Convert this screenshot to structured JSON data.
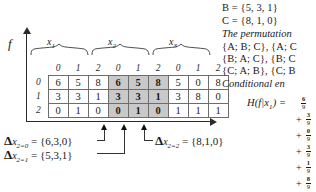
{
  "figure": {
    "axis": {
      "y_label": "f",
      "x_label": "x"
    },
    "groups": [
      {
        "name": "x",
        "sub": "1"
      },
      {
        "name": "x",
        "sub": "2"
      },
      {
        "name": "x",
        "sub": "3"
      }
    ],
    "table": {
      "column_headers": [
        "0",
        "1",
        "2",
        "0",
        "1",
        "2",
        "0",
        "1",
        "2"
      ],
      "row_headers": [
        "0",
        "1",
        "2"
      ],
      "rows": [
        [
          "6",
          "5",
          "8",
          "6",
          "5",
          "8",
          "5",
          "0",
          "8"
        ],
        [
          "3",
          "3",
          "1",
          "3",
          "3",
          "1",
          "3",
          "8",
          "0"
        ],
        [
          "0",
          "1",
          "0",
          "0",
          "1",
          "0",
          "1",
          "1",
          "1"
        ]
      ],
      "highlight_columns": [
        3,
        4,
        5
      ],
      "highlight_color": "#c9c9c9"
    },
    "annotations": [
      {
        "symbol": "Δ",
        "var": "x",
        "sub": "2=0",
        "eq": "=",
        "set": "{6,3,0}"
      },
      {
        "symbol": "Δ",
        "var": "x",
        "sub": "2=1",
        "eq": "=",
        "set": "{5,3,1}"
      },
      {
        "symbol": "Δ",
        "var": "x",
        "sub": "2=2",
        "eq": "=",
        "set": "{8,1,0}"
      }
    ]
  },
  "sidebar": {
    "set_b": "B = {5, 3, 1}",
    "set_c": "C = {8, 1, 0}",
    "permutation_intro": "The permutation",
    "permutation_lines": [
      "{A; B; C}, {A; C",
      "{B; A; C}, {B; C",
      "{C; A; B}, {C; B"
    ],
    "conditional_label": "Conditional   en",
    "entropy_label": "H(f|x",
    "entropy_sub": "1",
    "entropy_label_end": ") =",
    "terms": [
      {
        "op": "",
        "num": "6",
        "den": "9"
      },
      {
        "op": "+",
        "num": "3",
        "den": "9"
      },
      {
        "op": "+",
        "num": "0",
        "den": "9"
      },
      {
        "op": "+",
        "num": "3",
        "den": "9"
      },
      {
        "op": "+",
        "num": "1",
        "den": "9"
      },
      {
        "op": "+",
        "num": "8",
        "den": "9"
      }
    ]
  }
}
